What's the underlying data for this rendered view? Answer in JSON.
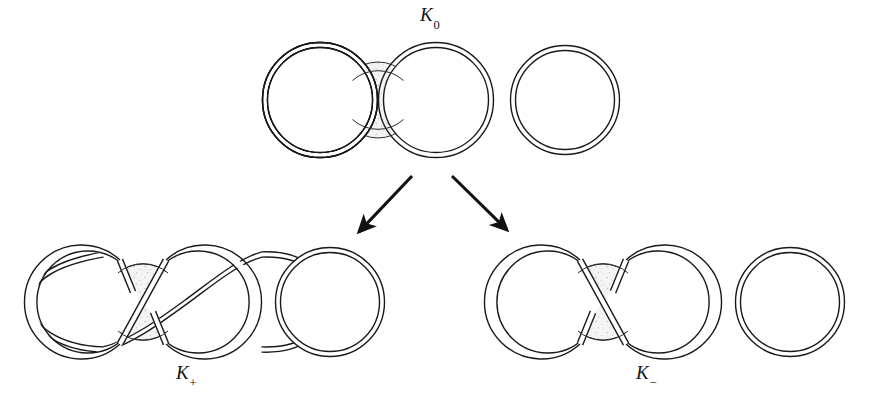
{
  "figure": {
    "name": "skein-triple-diagram",
    "background_color": "#ffffff",
    "stroke_color": "#1a1a1a",
    "shade_color": "#f2f2f2",
    "shade_speckle_color": "#c8c8c8"
  },
  "labels": {
    "k0": {
      "base": "K",
      "sub": "0",
      "full": "K0"
    },
    "k_plus": {
      "base": "K",
      "sub": "+",
      "full": "K+"
    },
    "k_minus": {
      "base": "K",
      "sub": "−",
      "full": "K−"
    }
  },
  "diagrams": [
    {
      "id": "k0",
      "label": "K0",
      "row": "top",
      "crossing_type": "none",
      "tangle": "zero-tangle",
      "components": 2,
      "rings": [
        {
          "name": "left-ring",
          "cx": 320,
          "cy": 100,
          "r": 55
        },
        {
          "name": "right-ring",
          "cx": 436,
          "cy": 100,
          "r": 55
        },
        {
          "name": "separate-ring",
          "cx": 565,
          "cy": 100,
          "r": 52
        }
      ],
      "shaded_disk": {
        "cx": 378,
        "cy": 100,
        "r": 38
      }
    },
    {
      "id": "k_plus",
      "label": "K+",
      "row": "bottom",
      "crossing_type": "positive",
      "tangle": "infinity-tangle",
      "components": 2,
      "rings": [
        {
          "name": "left-lobe",
          "cx": 85,
          "cy": 302,
          "r": 56
        },
        {
          "name": "right-lobe",
          "cx": 200,
          "cy": 302,
          "r": 56
        },
        {
          "name": "separate-ring",
          "cx": 330,
          "cy": 302,
          "r": 52
        }
      ],
      "shaded_disk": {
        "cx": 143,
        "cy": 302,
        "r": 38
      }
    },
    {
      "id": "k_minus",
      "label": "K−",
      "row": "bottom",
      "crossing_type": "negative",
      "tangle": "infinity-tangle",
      "components": 2,
      "rings": [
        {
          "name": "left-lobe",
          "cx": 545,
          "cy": 302,
          "r": 56
        },
        {
          "name": "right-lobe",
          "cx": 660,
          "cy": 302,
          "r": 56
        },
        {
          "name": "separate-ring",
          "cx": 790,
          "cy": 302,
          "r": 52
        }
      ],
      "shaded_disk": {
        "cx": 603,
        "cy": 302,
        "r": 38
      }
    }
  ],
  "arrows": [
    {
      "name": "arrow-to-k-plus",
      "x1": 412,
      "y1": 176,
      "x2": 356,
      "y2": 235,
      "direction": "down-left"
    },
    {
      "name": "arrow-to-k-minus",
      "x1": 452,
      "y1": 176,
      "x2": 510,
      "y2": 233,
      "direction": "down-right"
    }
  ]
}
